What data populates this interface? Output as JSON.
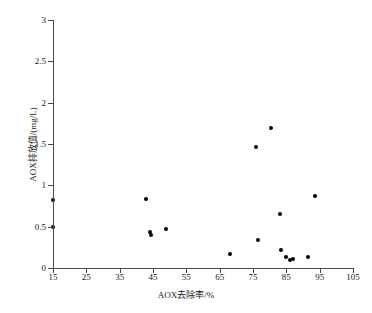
{
  "chart_data": {
    "type": "scatter",
    "title": "",
    "xlabel": "AOX去除率/%",
    "ylabel": "AOX排放值/(mg/L)",
    "xlim": [
      15,
      105
    ],
    "ylim": [
      0,
      3
    ],
    "xticks": [
      15,
      25,
      35,
      45,
      55,
      65,
      75,
      85,
      95,
      105
    ],
    "yticks": [
      0,
      0.5,
      1,
      1.5,
      2,
      2.5,
      3
    ],
    "xtick_labels": [
      "15",
      "25",
      "35",
      "45",
      "55",
      "65",
      "75",
      "85",
      "95",
      "105"
    ],
    "ytick_labels": [
      "0",
      "0.5",
      "1",
      "1.5",
      "2",
      "2.5",
      "3"
    ],
    "grid": false,
    "legend": null,
    "marker": "filled-circle",
    "marker_color": "#000000",
    "points": [
      {
        "x": 15.0,
        "y": 0.82
      },
      {
        "x": 15.0,
        "y": 0.5
      },
      {
        "x": 43.0,
        "y": 0.84
      },
      {
        "x": 44.0,
        "y": 0.43
      },
      {
        "x": 44.5,
        "y": 0.4
      },
      {
        "x": 49.0,
        "y": 0.47
      },
      {
        "x": 68.0,
        "y": 0.17
      },
      {
        "x": 76.0,
        "y": 1.46
      },
      {
        "x": 76.5,
        "y": 0.34
      },
      {
        "x": 80.5,
        "y": 1.69
      },
      {
        "x": 83.0,
        "y": 0.65
      },
      {
        "x": 83.5,
        "y": 0.22
      },
      {
        "x": 85.0,
        "y": 0.13
      },
      {
        "x": 86.0,
        "y": 0.1
      },
      {
        "x": 87.0,
        "y": 0.11
      },
      {
        "x": 91.5,
        "y": 0.13
      },
      {
        "x": 93.5,
        "y": 0.87
      }
    ]
  },
  "axes": {
    "x_title": "AOX去除率/%",
    "y_title": "AOX排放值/(mg/L)"
  }
}
